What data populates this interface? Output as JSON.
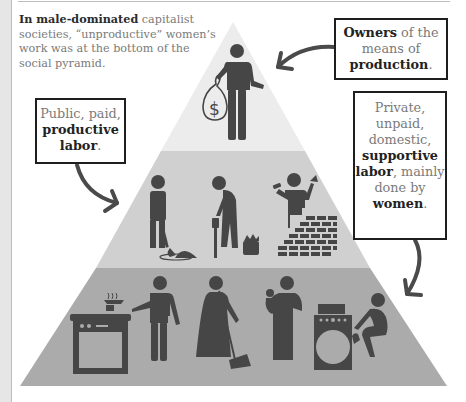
{
  "caption": {
    "bold": "In male-dominated",
    "rest": " capitalist societies, “unproductive” women’s work was at the bottom of the social pyramid."
  },
  "boxes": {
    "owners": {
      "bold1": "Owners",
      "text1": " of the means of ",
      "bold2": "production",
      "text2": "."
    },
    "public": {
      "text1": "Public, paid, ",
      "bold1": "productive labor",
      "text2": "."
    },
    "private": {
      "text1": "Private, unpaid, domestic, ",
      "bold1": "supportive labor",
      "text2": ", mainly done by ",
      "bold2": "women",
      "text3": "."
    }
  },
  "pyramid": {
    "tiers": [
      {
        "name": "owners",
        "figures": [
          "capitalist-with-money-bag"
        ],
        "color": "#ececec"
      },
      {
        "name": "productive-labor",
        "figures": [
          "digging-worker",
          "jackhammer-worker",
          "toolbox",
          "bricklayer"
        ],
        "color": "#d0d0d0"
      },
      {
        "name": "domestic-labor",
        "figures": [
          "stove",
          "cook-with-apron",
          "woman-sweeping",
          "woman-carrying-baby",
          "washing-machine-laundry"
        ],
        "color": "#ababab"
      }
    ],
    "figure_color": "#464646"
  },
  "colors": {
    "box_border": "#1e1e1e",
    "text_gray": "#7a7a7a",
    "text_bold": "#222222",
    "arrow": "#4a4a4a"
  }
}
